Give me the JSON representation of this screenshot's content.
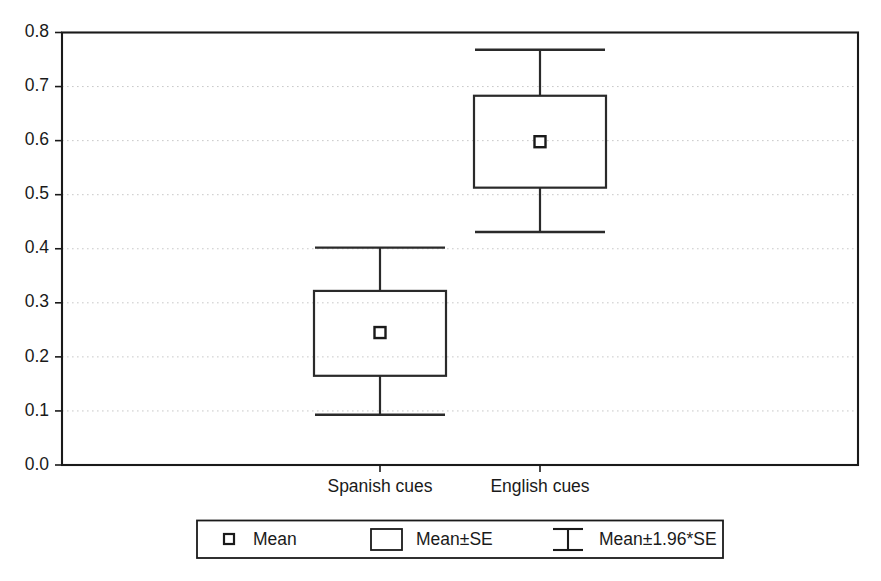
{
  "chart_data": {
    "type": "box",
    "title": "",
    "xlabel": "",
    "ylabel": "",
    "categories": [
      "Spanish cues",
      "English cues"
    ],
    "ylim": [
      0.0,
      0.8
    ],
    "ytick_labels": [
      "0.0",
      "0.1",
      "0.2",
      "0.3",
      "0.4",
      "0.5",
      "0.6",
      "0.7",
      "0.8"
    ],
    "ytick_values": [
      0.0,
      0.1,
      0.2,
      0.3,
      0.4,
      0.5,
      0.6,
      0.7,
      0.8
    ],
    "grid": true,
    "grid_axis": "y",
    "legend_position": "below-axes",
    "series": [
      {
        "name": "Spanish cues",
        "mean": 0.245,
        "se_low": 0.165,
        "se_high": 0.322,
        "ci_low": 0.093,
        "ci_high": 0.402
      },
      {
        "name": "English cues",
        "mean": 0.598,
        "se_low": 0.513,
        "se_high": 0.683,
        "ci_low": 0.431,
        "ci_high": 0.768
      }
    ],
    "legend": [
      {
        "label": "Mean",
        "symbol": "small-square"
      },
      {
        "label": "Mean±SE",
        "symbol": "rectangle"
      },
      {
        "label": "Mean±1.96*SE",
        "symbol": "i-bar"
      }
    ],
    "colors": {
      "axis": "#1a1a1a",
      "grid": "#c8c8c8",
      "box_stroke": "#2a2a2a",
      "marker_fill": "#ffffff",
      "background": "#ffffff"
    }
  }
}
